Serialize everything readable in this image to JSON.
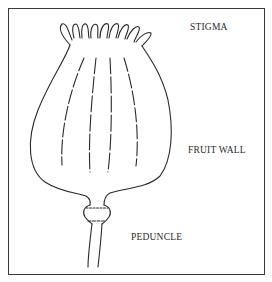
{
  "diagram": {
    "labels": {
      "stigma": "STIGMA",
      "fruit_wall": "FRUIT WALL",
      "peduncle": "PEDUNCLE"
    },
    "colors": {
      "line": "#2a2a2a",
      "background": "#ffffff",
      "border": "#3a3a3a"
    }
  }
}
